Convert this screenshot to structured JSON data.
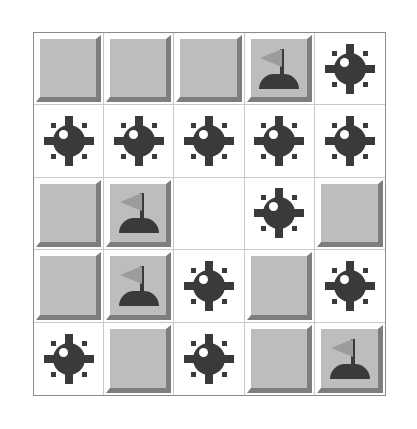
{
  "game": {
    "name": "Minesweeper",
    "grid_rows": 5,
    "grid_cols": 5,
    "cell_states": [
      [
        "covered",
        "covered",
        "covered",
        "flag",
        "mine"
      ],
      [
        "mine",
        "mine",
        "mine",
        "mine",
        "mine"
      ],
      [
        "covered",
        "flag",
        "empty",
        "mine",
        "covered"
      ],
      [
        "covered",
        "flag",
        "mine",
        "covered",
        "mine"
      ],
      [
        "mine",
        "covered",
        "mine",
        "covered",
        "flag"
      ]
    ],
    "counts": {
      "mines_shown": 12,
      "flags_placed": 4,
      "covered_cells": 8,
      "empty_revealed": 1
    },
    "icons": {
      "mine": "mine-icon",
      "flag": "flag-icon"
    },
    "colors": {
      "background": "#ffffff",
      "covered_fill": "#bdbdbd",
      "bevel_light": "#ffffff",
      "bevel_shadow": "#7d7d7d",
      "glyph_dark": "#3a3a3a",
      "flag_pennant": "#9c9c9c",
      "grid_line": "#c9c9c9",
      "board_border": "#8c8c8c",
      "revealed_fill": "#ffffff"
    }
  }
}
